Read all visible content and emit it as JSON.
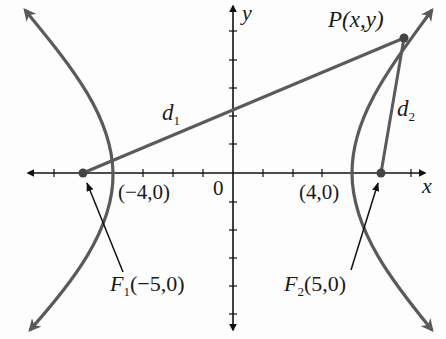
{
  "diagram": {
    "type": "hyperbola with foci",
    "equation_context": "hyperbola x^2/16 - y^2/9 = 1",
    "colors": {
      "curve": "#5a5a5a",
      "axis": "#111111",
      "text": "#1a1a1a"
    },
    "axes": {
      "x_label": "x",
      "y_label": "y",
      "origin_label": "0"
    },
    "vertices": [
      {
        "label": "(−4,0)",
        "x": -4,
        "y": 0
      },
      {
        "label": "(4,0)",
        "x": 4,
        "y": 0
      }
    ],
    "foci": [
      {
        "name": "F",
        "sub": "1",
        "coords": "(−5,0)",
        "x": -5,
        "y": 0
      },
      {
        "name": "F",
        "sub": "2",
        "coords": "(5,0)",
        "x": 5,
        "y": 0
      }
    ],
    "point": {
      "label": "P(x,y)"
    },
    "distances": [
      {
        "name": "d",
        "sub": "1"
      },
      {
        "name": "d",
        "sub": "2"
      }
    ]
  }
}
